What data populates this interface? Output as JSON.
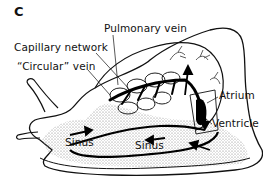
{
  "panel_letter": "C",
  "labels": {
    "pulmonary_vein": "Pulmonary vein",
    "capillary_network": "Capillary network",
    "circular_vein": "“Circular” vein",
    "atrium": "Atrium",
    "ventricle": "Ventricle",
    "sinus_head": "Sinus",
    "sinus_foot": "Sinus"
  },
  "colors": {
    "ink": "#111111",
    "stipple": "#9a9a9a",
    "background": "#ffffff"
  }
}
